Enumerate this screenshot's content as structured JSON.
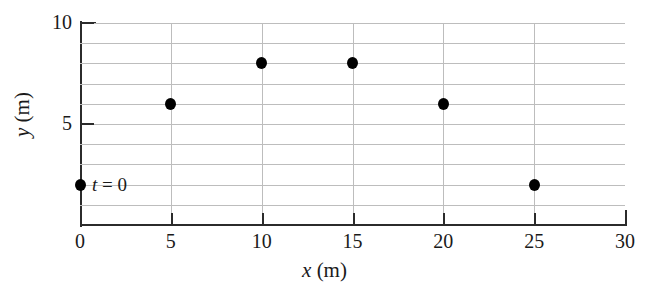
{
  "chart_data": {
    "type": "scatter",
    "title": "",
    "xlabel": "x (m)",
    "ylabel": "y (m)",
    "xlabel_symbol": "x",
    "xlabel_unit": "(m)",
    "ylabel_symbol": "y",
    "ylabel_unit": "(m)",
    "xlim": [
      0,
      30
    ],
    "ylim": [
      0,
      10
    ],
    "x_ticks": [
      0,
      5,
      10,
      15,
      20,
      25,
      30
    ],
    "x_tick_labels": [
      "0",
      "5",
      "10",
      "15",
      "20",
      "25",
      "30"
    ],
    "y_ticks": [
      5,
      10
    ],
    "y_tick_labels": [
      "5",
      "10"
    ],
    "grid": {
      "horizontal_values": [
        1,
        2,
        3,
        4,
        5,
        6,
        7,
        8,
        9,
        10
      ],
      "vertical_values": [
        5,
        10,
        15,
        20,
        25
      ],
      "color": "#bdbdbd"
    },
    "marker_color": "#000000",
    "axis_color": "#2b2b2b",
    "points": [
      {
        "x": 0,
        "y": 2
      },
      {
        "x": 5,
        "y": 6
      },
      {
        "x": 10,
        "y": 8
      },
      {
        "x": 15,
        "y": 8
      },
      {
        "x": 20,
        "y": 6
      },
      {
        "x": 25,
        "y": 2
      }
    ],
    "annotations": [
      {
        "text": "t = 0",
        "symbol": "t",
        "rest": " = 0",
        "x": 0,
        "y": 2
      }
    ]
  }
}
